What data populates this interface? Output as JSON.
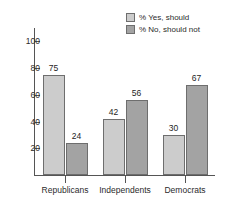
{
  "chart_data": {
    "type": "bar",
    "title": "",
    "subtitle": "",
    "xlabel": "",
    "ylabel": "",
    "categories": [
      "Republicans",
      "Independents",
      "Democrats"
    ],
    "series": [
      {
        "name": "% Yes, should",
        "values": [
          75,
          42,
          30
        ],
        "color": "#cccccc"
      },
      {
        "name": "% No, should not",
        "values": [
          24,
          56,
          67
        ],
        "color": "#a3a3a3"
      }
    ],
    "ylim": [
      0,
      110
    ],
    "yticks": [
      20,
      40,
      60,
      80,
      100
    ],
    "ytick_labels": [
      "20",
      "40",
      "60",
      "80",
      "100"
    ],
    "grid": false,
    "legend_position": "top-right",
    "data_labels": [
      [
        "75",
        "24"
      ],
      [
        "42",
        "56"
      ],
      [
        "30",
        "67"
      ]
    ]
  },
  "legend": {
    "entries": [
      {
        "label": "% Yes, should"
      },
      {
        "label": "% No, should not"
      }
    ]
  },
  "axis": {
    "y_labels": [
      "100",
      "80",
      "60",
      "40",
      "20"
    ],
    "x_labels": [
      "Republicans",
      "Independents",
      "Democrats"
    ]
  },
  "colors": {
    "series_light": "#cccccc",
    "series_dark": "#a3a3a3",
    "axis": "#555555",
    "text": "#2b2b2b",
    "background": "#ffffff"
  }
}
